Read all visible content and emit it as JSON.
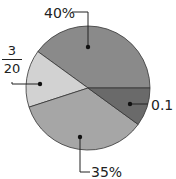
{
  "chart_data": {
    "type": "pie",
    "title": "",
    "slices": [
      {
        "label": "40%",
        "value": 40,
        "color": "#8a8a8a"
      },
      {
        "label": "3/20",
        "value": 15,
        "color": "#d2d2d2"
      },
      {
        "label": "35%",
        "value": 35,
        "color": "#a6a6a6"
      },
      {
        "label": "0.1",
        "value": 10,
        "color": "#6a6a6a"
      }
    ],
    "legend": "none"
  },
  "labels": {
    "forty": "40%",
    "frac_num": "3",
    "frac_den": "20",
    "thirtyfive": "35%",
    "tenth": "0.1"
  }
}
